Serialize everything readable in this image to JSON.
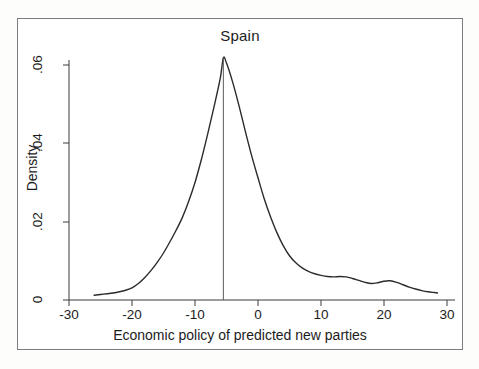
{
  "chart_data": {
    "type": "line",
    "title": "Spain",
    "subtitle": "",
    "xlabel": "Economic policy of predicted new parties",
    "ylabel": "Density",
    "xlim": [
      -30,
      30
    ],
    "ylim": [
      0,
      0.065
    ],
    "xticks": [
      -30,
      -20,
      -10,
      0,
      10,
      20,
      30
    ],
    "xtick_labels": [
      "-30",
      "-20",
      "-10",
      "0",
      "10",
      "20",
      "30"
    ],
    "yticks": [
      0,
      0.02,
      0.04,
      0.06
    ],
    "ytick_labels": [
      "0",
      ".02",
      ".04",
      ".06"
    ],
    "grid": false,
    "legend": null,
    "annotations": [
      {
        "name": "vertical-reference-line",
        "type": "vline",
        "x": -5.5,
        "y_top": 0.0618,
        "y_bottom": 0
      }
    ],
    "series": [
      {
        "name": "Kernel density of economic policy",
        "color": "#2b2b2b",
        "x": [
          -26.0,
          -25.0,
          -24.0,
          -23.0,
          -22.0,
          -21.0,
          -20.0,
          -19.0,
          -18.0,
          -17.0,
          -16.0,
          -15.0,
          -14.0,
          -13.0,
          -12.0,
          -11.0,
          -10.0,
          -9.0,
          -8.0,
          -7.0,
          -6.0,
          -5.5,
          -5.0,
          -4.0,
          -3.0,
          -2.0,
          -1.0,
          0.0,
          1.0,
          2.0,
          3.0,
          4.0,
          5.0,
          6.0,
          7.0,
          8.0,
          9.0,
          10.0,
          11.0,
          12.0,
          13.0,
          14.0,
          15.0,
          16.0,
          17.0,
          18.0,
          19.0,
          20.0,
          21.0,
          22.0,
          23.0,
          24.0,
          25.0,
          26.0,
          27.0,
          28.0,
          28.5
        ],
        "y": [
          0.0012,
          0.0014,
          0.0016,
          0.0018,
          0.0021,
          0.0025,
          0.0031,
          0.0042,
          0.0057,
          0.0075,
          0.0096,
          0.012,
          0.0148,
          0.0178,
          0.0211,
          0.0252,
          0.03,
          0.0358,
          0.0423,
          0.0492,
          0.0565,
          0.0618,
          0.0605,
          0.0555,
          0.0495,
          0.043,
          0.0368,
          0.0312,
          0.0258,
          0.0212,
          0.0172,
          0.0139,
          0.0113,
          0.0095,
          0.0082,
          0.0073,
          0.0067,
          0.0063,
          0.006,
          0.0059,
          0.006,
          0.0059,
          0.0055,
          0.005,
          0.0045,
          0.0042,
          0.0044,
          0.0048,
          0.0049,
          0.0045,
          0.0039,
          0.0033,
          0.0028,
          0.0024,
          0.0021,
          0.0019,
          0.0018
        ]
      }
    ]
  }
}
